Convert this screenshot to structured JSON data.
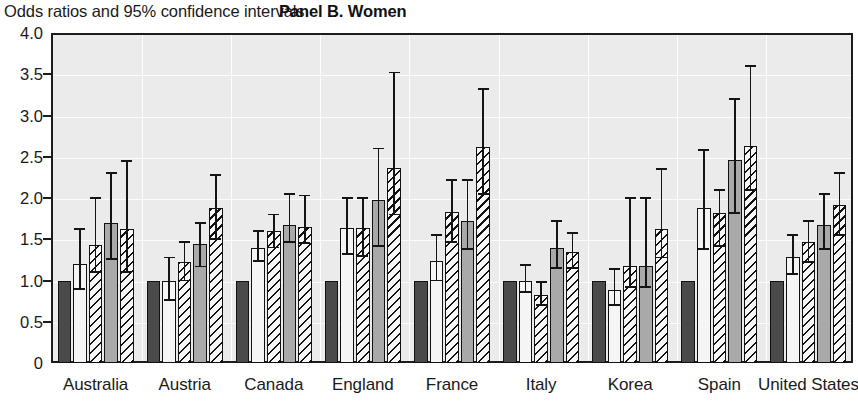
{
  "header": {
    "subtitle": "Odds ratios and 95% confidence intervals",
    "panel_title": "Panel B. Women"
  },
  "axis": {
    "y_ticks": [
      "4.0",
      "3.5",
      "3.0",
      "2.5",
      "2.0",
      "1.5",
      "1.0",
      "0.5",
      "0"
    ],
    "y_tick_values": [
      4.0,
      3.5,
      3.0,
      2.5,
      2.0,
      1.5,
      1.0,
      0.5,
      0
    ]
  },
  "colors": {
    "plot_background": "#ebebeb",
    "frame": "#1c1c1c",
    "gridline": "#fbfbfb",
    "series_dark": "#4a4a4a",
    "series_white": "#f5f5f5",
    "series_gray": "#a9a9a9",
    "hatch_ink": "#111111",
    "error_bar": "#141414",
    "text": "#1a1a1a"
  },
  "chart_data": {
    "type": "bar",
    "title": "Panel B. Women",
    "subtitle": "Odds ratios and 95% confidence intervals",
    "xlabel": "",
    "ylabel": "",
    "ylim": [
      0,
      4.0
    ],
    "ytick_step": 0.5,
    "grid": true,
    "legend": "none",
    "categories": [
      "Australia",
      "Austria",
      "Canada",
      "England",
      "France",
      "Italy",
      "Korea",
      "Spain",
      "United States"
    ],
    "series": [
      {
        "name": "Series 1",
        "pattern": "solid-dark",
        "values": [
          1.0,
          1.0,
          1.0,
          1.0,
          1.0,
          1.0,
          1.0,
          1.0,
          1.0
        ],
        "ci_low": [
          null,
          null,
          null,
          null,
          null,
          null,
          null,
          null,
          null
        ],
        "ci_high": [
          null,
          null,
          null,
          null,
          null,
          null,
          null,
          null,
          null
        ]
      },
      {
        "name": "Series 2",
        "pattern": "solid-white",
        "values": [
          1.2,
          1.0,
          1.4,
          1.64,
          1.24,
          1.0,
          0.88,
          1.88,
          1.28
        ],
        "ci_low": [
          0.9,
          0.76,
          1.24,
          1.32,
          1.0,
          0.86,
          0.7,
          1.38,
          1.08
        ],
        "ci_high": [
          1.62,
          1.28,
          1.6,
          2.0,
          1.55,
          1.19,
          1.14,
          2.58,
          1.55
        ]
      },
      {
        "name": "Series 3",
        "pattern": "hatch",
        "values": [
          1.43,
          1.22,
          1.6,
          1.64,
          1.83,
          0.82,
          1.18,
          1.82,
          1.47
        ],
        "ci_low": [
          1.1,
          1.0,
          1.4,
          1.3,
          1.47,
          0.7,
          0.92,
          1.42,
          1.22
        ],
        "ci_high": [
          2.0,
          1.47,
          1.8,
          2.0,
          2.22,
          0.98,
          2.0,
          2.1,
          1.72
        ]
      },
      {
        "name": "Series 4",
        "pattern": "solid-gray",
        "values": [
          1.7,
          1.44,
          1.67,
          1.97,
          1.72,
          1.4,
          1.18,
          2.46,
          1.67
        ],
        "ci_low": [
          1.26,
          1.17,
          1.47,
          1.42,
          1.38,
          1.15,
          0.92,
          1.82,
          1.38
        ],
        "ci_high": [
          2.3,
          1.7,
          2.05,
          2.6,
          2.22,
          1.72,
          2.0,
          3.2,
          2.05
        ]
      },
      {
        "name": "Series 5",
        "pattern": "hatch",
        "values": [
          1.62,
          1.88,
          1.65,
          2.36,
          2.62,
          1.35,
          1.63,
          2.63,
          1.92
        ],
        "ci_low": [
          1.1,
          1.5,
          1.45,
          1.8,
          2.05,
          1.15,
          1.28,
          2.1,
          1.55
        ],
        "ci_high": [
          2.45,
          2.28,
          2.03,
          3.52,
          3.32,
          1.58,
          2.35,
          3.6,
          2.3
        ]
      }
    ]
  }
}
